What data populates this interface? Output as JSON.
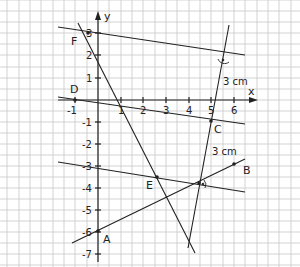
{
  "axes": {
    "x_label": "x",
    "y_label": "y",
    "x_ticks": [
      "-1",
      "1",
      "2",
      "3",
      "4",
      "5",
      "6"
    ],
    "y_ticks": [
      "3",
      "2",
      "1",
      "-1",
      "-2",
      "-3",
      "-4",
      "-5",
      "-6",
      "-7"
    ]
  },
  "points": {
    "A": "A",
    "B": "B",
    "C": "C",
    "D": "D",
    "E": "E",
    "F": "F"
  },
  "annotations": {
    "distance_top": "3 cm",
    "distance_bottom": "3 cm"
  },
  "colors": {
    "grid": "#c8c8c8",
    "line": "#222222"
  }
}
